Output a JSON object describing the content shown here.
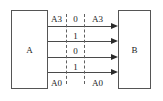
{
  "diagram": {
    "blocks": [
      {
        "id": "a",
        "label": "A"
      },
      {
        "id": "b",
        "label": "B"
      }
    ],
    "bus_labels": {
      "left_top": "A3",
      "left_bottom": "A0",
      "right_top": "A3",
      "right_bottom": "A0"
    },
    "channel_bits": [
      "0",
      "1",
      "0",
      "1"
    ],
    "wire_count": 4,
    "colors": {
      "line": "#4a4a4a",
      "arrow": "#2b2b2b",
      "border": "#555555",
      "dashed": "#606060",
      "text": "#1a1a1a",
      "background": "#ffffff"
    }
  }
}
